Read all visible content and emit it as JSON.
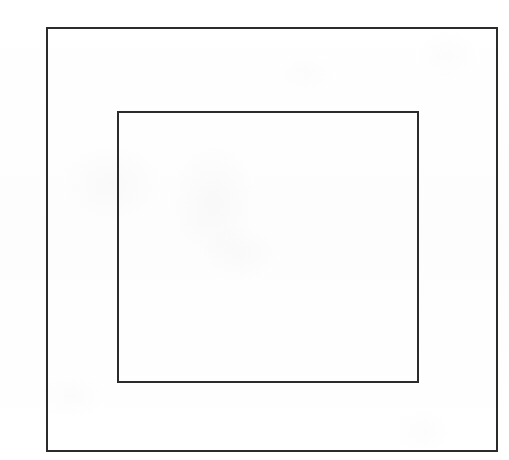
{
  "figure": {
    "domain": "Document",
    "kind": "line-drawing",
    "canvas": {
      "width": 509,
      "height": 460,
      "background_color": "#ffffff",
      "paper_tone": "#fefefe"
    },
    "style": {
      "stroke_color": "#2b2b2b",
      "stroke_width": 1.2,
      "fill": "none",
      "line_cap": "butt",
      "line_join": "miter"
    },
    "shapes": [
      {
        "id": "outer-rectangle",
        "name": "outer-rectangle",
        "label": "Outer rectangle",
        "type": "rectangle",
        "x": 47,
        "y": 28,
        "width": 450,
        "height": 423,
        "stroke_color": "#2b2b2b",
        "stroke_width": 1.2,
        "fill": "none"
      },
      {
        "id": "inner-rectangle",
        "name": "inner-rectangle",
        "label": "Inner rectangle",
        "type": "rectangle",
        "x": 118,
        "y": 112,
        "width": 300,
        "height": 270,
        "stroke_color": "#2b2b2b",
        "stroke_width": 1.2,
        "fill": "none"
      }
    ],
    "margins": {
      "outer_to_inner_left": 71,
      "outer_to_inner_top": 84,
      "outer_to_inner_right": 79,
      "outer_to_inner_bottom": 69
    },
    "annotations": [],
    "text": []
  }
}
